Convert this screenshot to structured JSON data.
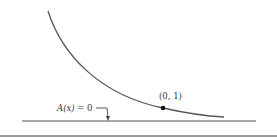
{
  "diagram": {
    "curve": {
      "color": "#555555",
      "description": "decreasing exponential-type curve approaching horizontal asymptote"
    },
    "point": {
      "label": "(0, 1)"
    },
    "asymptote": {
      "label_func": "A(x)",
      "label_rest": " = 0"
    },
    "colors": {
      "line": "#555555",
      "point": "#111111",
      "separator": "#777777"
    }
  }
}
